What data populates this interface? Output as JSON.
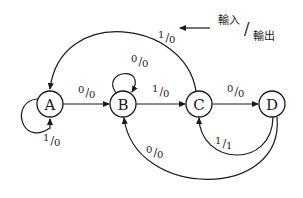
{
  "diagram": {
    "type": "state-transition",
    "legend": {
      "input_label": "輸入",
      "output_label": "輸出",
      "separator": "/"
    },
    "nodes": [
      {
        "id": "A",
        "label": "A"
      },
      {
        "id": "B",
        "label": "B"
      },
      {
        "id": "C",
        "label": "C"
      },
      {
        "id": "D",
        "label": "D"
      }
    ],
    "edges": [
      {
        "from": "A",
        "to": "A",
        "input": "1",
        "output": "0"
      },
      {
        "from": "A",
        "to": "B",
        "input": "0",
        "output": "0"
      },
      {
        "from": "B",
        "to": "B",
        "input": "0",
        "output": "0"
      },
      {
        "from": "B",
        "to": "C",
        "input": "1",
        "output": "0"
      },
      {
        "from": "C",
        "to": "D",
        "input": "0",
        "output": "0"
      },
      {
        "from": "C",
        "to": "A",
        "input": "1",
        "output": "0"
      },
      {
        "from": "D",
        "to": "C",
        "input": "1",
        "output": "1"
      },
      {
        "from": "D",
        "to": "B",
        "input": "0",
        "output": "0"
      }
    ]
  }
}
